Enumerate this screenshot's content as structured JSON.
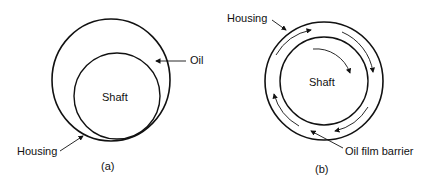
{
  "panel_a": {
    "shaft_label": "Shaft",
    "oil_label": "Oil",
    "housing_label": "Housing",
    "caption": "(a)"
  },
  "panel_b": {
    "shaft_label": "Shaft",
    "housing_label": "Housing",
    "barrier_label": "Oil film barrier",
    "caption": "(b)"
  },
  "colors": {
    "stroke": "#111111",
    "background": "#ffffff"
  }
}
